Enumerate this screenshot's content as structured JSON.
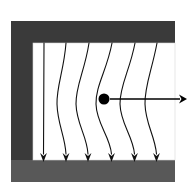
{
  "figure": {
    "type": "physics-field-diagram",
    "canvas": {
      "width": 189,
      "height": 193,
      "background": "#ffffff"
    },
    "magnet": {
      "label": "C-shaped magnet yoke",
      "top_arm": {
        "x": 11,
        "y": 21,
        "width": 164,
        "height": 22,
        "color": "#3a3a3a"
      },
      "left_arm": {
        "x": 11,
        "y": 21,
        "width": 22,
        "height": 161,
        "color": "#3a3a3a"
      },
      "bottom_arm": {
        "x": 11,
        "y": 160,
        "width": 164,
        "height": 22,
        "color": "#585858"
      },
      "gap": {
        "x": 33,
        "y": 43,
        "width": 142,
        "height": 117,
        "color": "#ffffff"
      }
    },
    "field_lines": {
      "label": "magnetic field lines (pointing down)",
      "count": 6,
      "direction": "downward",
      "color": "#111111",
      "stroke_width": 1.1,
      "y_start": 43,
      "y_end": 162,
      "paths": [
        "M44,43 C44,83 44,120 43.5,154",
        "M66,43 C64,70 56.5,86 57,104 C57.5,124 65,136 66,154",
        "M89,43 C85,70 75.5,86 76,104 C76.5,124 87,136 88,154",
        "M112,43 C107,70 95.5,86 96,104 C96.5,124 110,136 111.5,154",
        "M135,43 C130,70 119.5,86 120,104 C120.5,124 133,136 134.5,154",
        "M157,43 C152,70 144.5,86 145,104 C145.5,124 155,136 156.5,154"
      ],
      "arrow_tips_y": 162,
      "arrow_tips_x": [
        43.5,
        66,
        88,
        111.5,
        134.5,
        156.5
      ]
    },
    "particle": {
      "label": "charged particle",
      "cx": 104,
      "cy": 99,
      "radius": 5.5,
      "color": "#000000"
    },
    "velocity_arrow": {
      "label": "velocity vector (to the right)",
      "x_start": 110,
      "x_end": 180,
      "y": 99,
      "color": "#000000",
      "stroke_width": 1.6,
      "head_length": 8,
      "head_half_width": 4.5,
      "tip_x": 187
    }
  }
}
